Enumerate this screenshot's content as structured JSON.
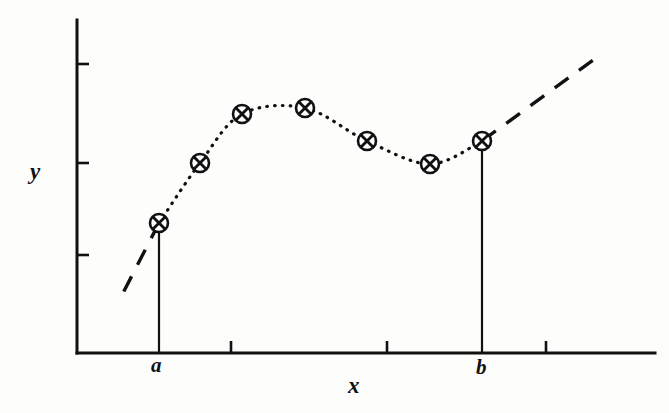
{
  "figure": {
    "kind": "line-chart-with-marked-data-points",
    "background_color": "#fdfdfc",
    "ink_color": "#111111",
    "axis_labels": {
      "y": "y",
      "x": "x",
      "a": "a",
      "b": "b"
    }
  },
  "chart_data": {
    "type": "scatter",
    "title": "",
    "subtitle": "",
    "xlabel": "x",
    "ylabel": "y",
    "grid": false,
    "legend": null,
    "xlim": [
      77,
      655
    ],
    "ylim": [
      353,
      20
    ],
    "axes": {
      "y_axis": {
        "x": 77,
        "y_top": 20,
        "y_bottom": 353,
        "width": 3
      },
      "x_axis": {
        "y": 353,
        "x_left": 77,
        "x_right": 655,
        "width": 3
      }
    },
    "x_tick_positions": [
      231,
      387,
      546
    ],
    "x_tick_labels": [
      "",
      "",
      ""
    ],
    "y_tick_positions": [
      64,
      163,
      255
    ],
    "y_tick_labels": [
      "",
      "",
      ""
    ],
    "tick_length": 12,
    "named_x_ticks": [
      {
        "label": "a",
        "x": 158
      },
      {
        "label": "b",
        "x": 482
      }
    ],
    "marker_style": "circle-with-cross",
    "marker_radius": 9,
    "connector_style": "dotted",
    "points": [
      {
        "x": 159,
        "y": 223,
        "label": "a"
      },
      {
        "x": 200,
        "y": 163,
        "label": ""
      },
      {
        "x": 242,
        "y": 114,
        "label": ""
      },
      {
        "x": 305,
        "y": 108,
        "label": ""
      },
      {
        "x": 367,
        "y": 141,
        "label": ""
      },
      {
        "x": 430,
        "y": 164,
        "label": ""
      },
      {
        "x": 482,
        "y": 141,
        "label": "b"
      }
    ],
    "drop_lines": [
      {
        "x": 159,
        "y_from": 223,
        "y_to": 353
      },
      {
        "x": 482,
        "y_from": 141,
        "y_to": 353
      }
    ],
    "extrapolation_segments": [
      {
        "style": "dashed",
        "x1": 159,
        "y1": 223,
        "x2": 123,
        "y2": 293
      },
      {
        "style": "dashed",
        "x1": 482,
        "y1": 141,
        "x2": 600,
        "y2": 55
      }
    ],
    "annotations": [
      "dotted interpolating curve through seven marked data points",
      "solid vertical ordinates drop from the endpoints a and b to the x-axis",
      "dashed line extends the trend beyond both endpoints"
    ]
  }
}
